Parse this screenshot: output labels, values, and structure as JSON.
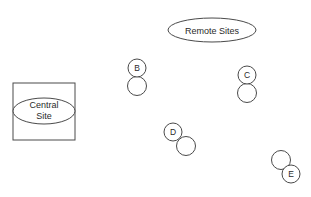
{
  "diagram": {
    "central_site": {
      "label_line1": "Central",
      "label_line2": "Site",
      "box": {
        "x": 13,
        "y": 83,
        "w": 62,
        "h": 57
      },
      "ellipse": {
        "cx": 44,
        "cy": 111,
        "rx": 31,
        "ry": 13
      }
    },
    "remote_sites_label": {
      "text": "Remote Sites",
      "ellipse": {
        "cx": 212,
        "cy": 30,
        "rx": 44,
        "ry": 12
      }
    },
    "sites": [
      {
        "name": "B",
        "label_circle": {
          "cx": 137,
          "cy": 68,
          "r": 9
        },
        "node_circle": {
          "cx": 137,
          "cy": 86,
          "r": 9.5
        }
      },
      {
        "name": "C",
        "label_circle": {
          "cx": 247,
          "cy": 75,
          "r": 9
        },
        "node_circle": {
          "cx": 247,
          "cy": 93,
          "r": 9.5
        }
      },
      {
        "name": "D",
        "label_circle": {
          "cx": 173,
          "cy": 132,
          "r": 9
        },
        "node_circle": {
          "cx": 186,
          "cy": 146,
          "r": 9.5
        }
      },
      {
        "name": "E",
        "label_circle": {
          "cx": 291,
          "cy": 174,
          "r": 9
        },
        "node_circle": {
          "cx": 281,
          "cy": 160,
          "r": 9.5
        }
      }
    ],
    "colors": {
      "stroke": "#4a4a4a",
      "text": "#2a2a2a",
      "background": "#ffffff"
    }
  }
}
